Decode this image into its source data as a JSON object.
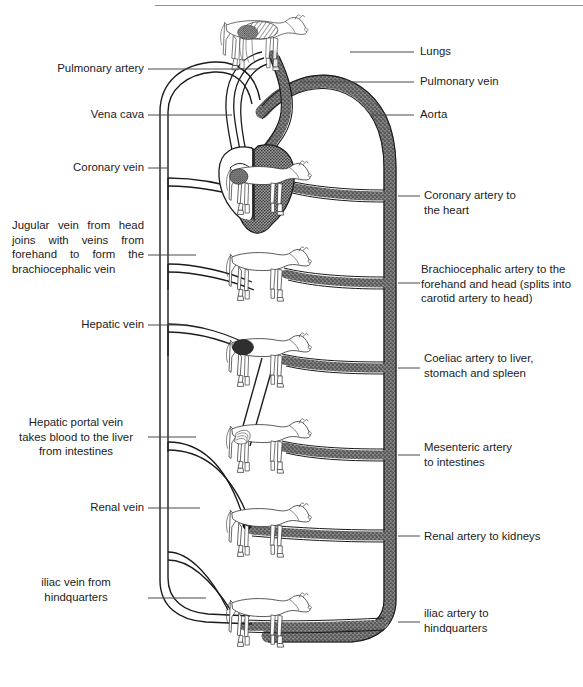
{
  "page": {
    "header_rule": true,
    "background_color": "#ffffff",
    "ink_color": "#1b1b1b"
  },
  "colors": {
    "artery": "#6b6b6b",
    "vein": "#1b1b1b",
    "leader_line": "#4a4a4a",
    "horse_outline": "#3a3a3a"
  },
  "labels": {
    "left": [
      {
        "id": "pulmonary-artery",
        "text": "Pulmonary artery"
      },
      {
        "id": "vena-cava",
        "text": "Vena cava"
      },
      {
        "id": "coronary-vein",
        "text": "Coronary vein"
      },
      {
        "id": "jugular-vein",
        "text": "Jugular vein from head joins with veins from forehand to form the brachiocephalic vein"
      },
      {
        "id": "hepatic-vein",
        "text": "Hepatic vein"
      },
      {
        "id": "hepatic-portal-vein",
        "text": "Hepatic portal vein\ntakes blood to the liver\nfrom intestines"
      },
      {
        "id": "renal-vein",
        "text": "Renal vein"
      },
      {
        "id": "iliac-vein",
        "text": "iliac vein from\nhindquarters"
      }
    ],
    "right": [
      {
        "id": "lungs",
        "text": "Lungs"
      },
      {
        "id": "pulmonary-vein",
        "text": "Pulmonary vein"
      },
      {
        "id": "aorta",
        "text": "Aorta"
      },
      {
        "id": "coronary-artery",
        "text": "Coronary artery to\nthe heart"
      },
      {
        "id": "brachiocephalic-artery",
        "text": "Brachiocephalic artery to the\nforehand and head (splits into\ncarotid artery to head)"
      },
      {
        "id": "coeliac-artery",
        "text": "Coeliac artery to liver,\nstomach and spleen"
      },
      {
        "id": "mesenteric-artery",
        "text": "Mesenteric artery\nto intestines"
      },
      {
        "id": "renal-artery",
        "text": "Renal artery to kidneys"
      },
      {
        "id": "iliac-artery",
        "text": "iliac artery to\nhindquarters"
      }
    ]
  },
  "figures": {
    "lung_horse": "horse-with-lungs-highlighted",
    "body_horses": [
      "horse-heart-coronary",
      "horse-forehand-head",
      "horse-liver-stomach-spleen",
      "horse-intestines",
      "horse-kidneys",
      "horse-hindquarters"
    ]
  }
}
